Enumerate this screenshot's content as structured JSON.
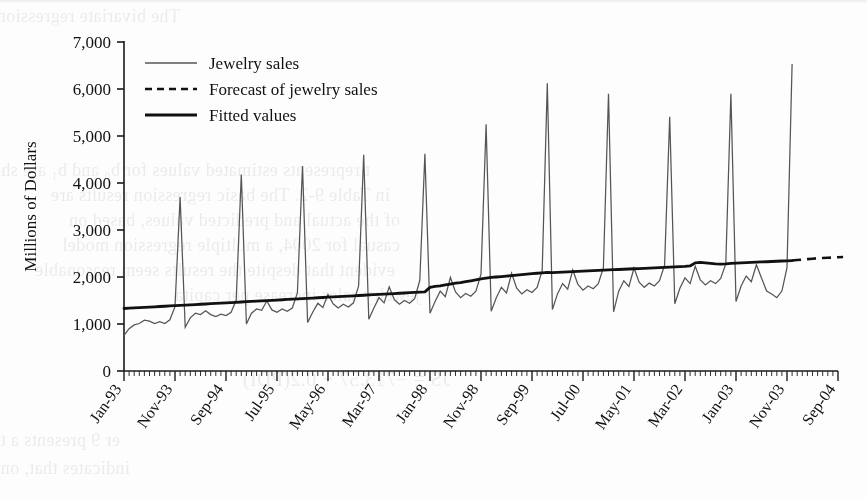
{
  "chart_data": {
    "type": "line",
    "title": "",
    "xlabel": "",
    "ylabel": "Millions of Dollars",
    "ylim": [
      0,
      7000
    ],
    "yticks": [
      0,
      1000,
      2000,
      3000,
      4000,
      5000,
      6000,
      7000
    ],
    "ytick_labels": [
      "0",
      "1,000",
      "2,000",
      "3,000",
      "4,000",
      "5,000",
      "6,000",
      "7,000"
    ],
    "xtick_labels": [
      "Jan-93",
      "Nov-93",
      "Sep-94",
      "Jul-95",
      "May-96",
      "Mar-97",
      "Jan-98",
      "Nov-98",
      "Sep-99",
      "Jul-00",
      "May-01",
      "Mar-02",
      "Jan-03",
      "Nov-03",
      "Sep-04"
    ],
    "x_start_label": "Jan-93",
    "x_end_label": "Sep-04",
    "grid": false,
    "legend_position": "top-left",
    "legend": [
      {
        "label": "Jewelry sales",
        "style": "solid-thin",
        "color": "#555555"
      },
      {
        "label": "Forecast of jewelry sales",
        "style": "dashed",
        "color": "#111111"
      },
      {
        "label": "Fitted values",
        "style": "solid-thick",
        "color": "#111111"
      }
    ],
    "series": [
      {
        "name": "Jewelry sales",
        "style": "solid-thin",
        "color": "#555555",
        "x_first": "Jan-93",
        "x_step_months": 1,
        "values": [
          760,
          900,
          980,
          1010,
          1080,
          1060,
          1010,
          1050,
          1010,
          1090,
          1370,
          3700,
          930,
          1130,
          1230,
          1200,
          1280,
          1200,
          1160,
          1210,
          1180,
          1250,
          1510,
          4180,
          1000,
          1230,
          1320,
          1290,
          1490,
          1300,
          1250,
          1320,
          1270,
          1340,
          1660,
          4360,
          1030,
          1250,
          1440,
          1350,
          1630,
          1430,
          1340,
          1420,
          1360,
          1450,
          1810,
          4600,
          1100,
          1340,
          1560,
          1450,
          1790,
          1520,
          1420,
          1500,
          1440,
          1540,
          1930,
          4620,
          1230,
          1480,
          1700,
          1580,
          1990,
          1680,
          1560,
          1650,
          1590,
          1700,
          2060,
          5250,
          1270,
          1560,
          1780,
          1660,
          2080,
          1760,
          1640,
          1730,
          1670,
          1780,
          2140,
          6120,
          1310,
          1640,
          1860,
          1740,
          2150,
          1840,
          1720,
          1810,
          1750,
          1860,
          2200,
          5900,
          1260,
          1700,
          1920,
          1800,
          2190,
          1890,
          1780,
          1870,
          1810,
          1920,
          2250,
          5410,
          1430,
          1760,
          1980,
          1860,
          2230,
          1940,
          1830,
          1920,
          1860,
          1970,
          2280,
          5900,
          1480,
          1810,
          2020,
          1900,
          2260,
          1980,
          1700,
          1640,
          1560,
          1700,
          2200,
          6530
        ],
        "peak_values": [
          3700,
          4180,
          4360,
          4600,
          4620,
          5250,
          6120,
          5900,
          5410,
          5900,
          6530
        ],
        "peak_months": [
          "Dec-93",
          "Dec-94",
          "Dec-95",
          "Dec-96",
          "Dec-97",
          "Dec-98",
          "Dec-99",
          "Dec-00",
          "Dec-01",
          "Dec-02",
          "Dec-03"
        ]
      },
      {
        "name": "Fitted values",
        "style": "solid-thick",
        "color": "#111111",
        "x_first": "Jan-93",
        "x_step_months": 1,
        "values": [
          1330,
          1336,
          1342,
          1348,
          1354,
          1360,
          1366,
          1372,
          1378,
          1384,
          1390,
          1396,
          1402,
          1408,
          1414,
          1420,
          1426,
          1432,
          1438,
          1444,
          1450,
          1456,
          1462,
          1468,
          1474,
          1480,
          1486,
          1492,
          1498,
          1504,
          1510,
          1516,
          1522,
          1528,
          1534,
          1540,
          1546,
          1552,
          1558,
          1564,
          1570,
          1576,
          1582,
          1588,
          1594,
          1600,
          1606,
          1612,
          1618,
          1624,
          1630,
          1636,
          1642,
          1648,
          1654,
          1660,
          1666,
          1672,
          1678,
          1684,
          1780,
          1800,
          1810,
          1830,
          1850,
          1870,
          1880,
          1900,
          1920,
          1940,
          1960,
          1975,
          1990,
          2000,
          2010,
          2020,
          2030,
          2040,
          2050,
          2060,
          2070,
          2080,
          2090,
          2100,
          2095,
          2100,
          2105,
          2110,
          2115,
          2120,
          2125,
          2130,
          2135,
          2140,
          2145,
          2150,
          2155,
          2160,
          2165,
          2170,
          2175,
          2180,
          2185,
          2190,
          2195,
          2200,
          2205,
          2210,
          2215,
          2220,
          2225,
          2235,
          2300,
          2310,
          2300,
          2290,
          2280,
          2275,
          2280,
          2290,
          2295,
          2300,
          2305,
          2310,
          2315,
          2320,
          2325,
          2330,
          2335,
          2340,
          2345,
          2350
        ]
      },
      {
        "name": "Forecast of jewelry sales",
        "style": "dashed",
        "color": "#111111",
        "x_first": "Dec-03",
        "x_step_months": 1,
        "values": [
          2350,
          2360,
          2370,
          2380,
          2390,
          2400,
          2405,
          2410,
          2415,
          2420,
          2425
        ]
      }
    ]
  },
  "ghost_text": {
    "lines": [
      {
        "text": "The bivariate regression model for JS as a function of PDI",
        "x": 180,
        "y": 6,
        "size": 18
      },
      {
        "text": "t represents estimated values for b₀ and b₁ are shown",
        "x": 370,
        "y": 160,
        "size": 18
      },
      {
        "text": "in Table 9-2. The basic regression results are",
        "x": 390,
        "y": 185,
        "size": 18
      },
      {
        "text": "of the actual and predicted values, based on",
        "x": 400,
        "y": 210,
        "size": 18
      },
      {
        "text": "casual for 2004, a multiple regression model",
        "x": 400,
        "y": 235,
        "size": 18
      },
      {
        "text": "evident that despite the results seem reasonable",
        "x": 395,
        "y": 260,
        "size": 18
      },
      {
        "text": "jewelry sales increase per capita",
        "x": 420,
        "y": 285,
        "size": 18
      },
      {
        "text": "JS = −713.57 + 0.2(PDI)",
        "x": 450,
        "y": 368,
        "size": 20
      },
      {
        "text": "er 9 presents a two-variable regression model. The",
        "x": 120,
        "y": 430,
        "size": 18
      },
      {
        "text": "indicates that, on average, JS increases by 0.2 million dollars",
        "x": 130,
        "y": 458,
        "size": 18
      }
    ]
  }
}
